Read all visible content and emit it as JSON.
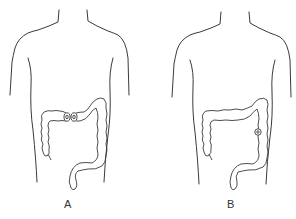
{
  "figures": [
    {
      "id": "A",
      "label": "A",
      "description": "Torso outline with colon; double-barrel transverse colostomy (two adjacent stomas)",
      "stoma_count": 2
    },
    {
      "id": "B",
      "label": "B",
      "description": "Torso outline with colon; single stoma on descending colon",
      "stoma_count": 1
    }
  ],
  "colors": {
    "line": "#3a3a3a",
    "background": "#ffffff"
  }
}
